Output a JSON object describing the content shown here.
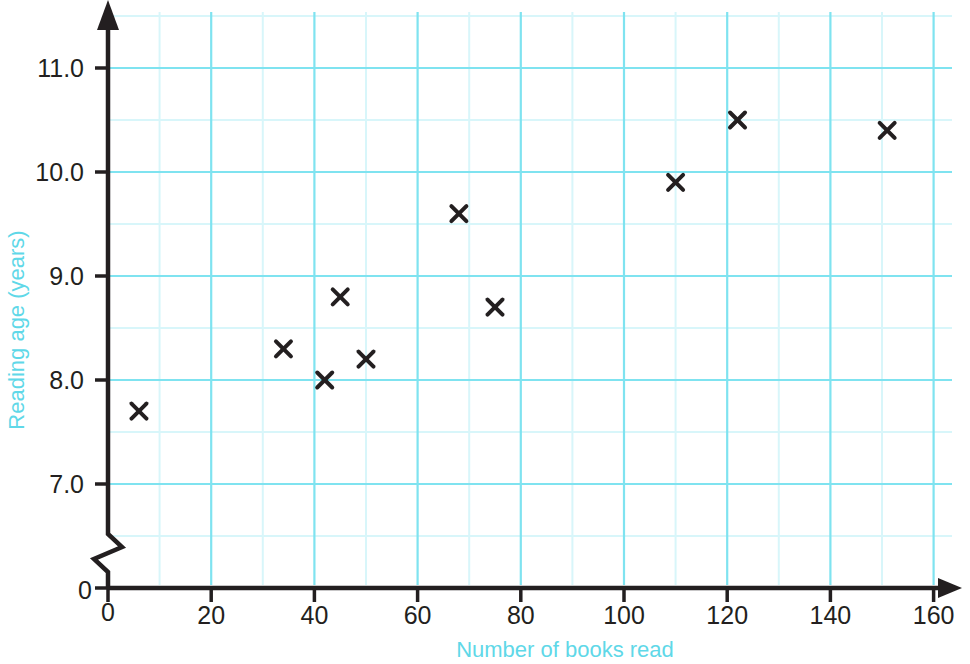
{
  "chart_data": {
    "type": "scatter",
    "title": "",
    "xlabel": "Number of books read",
    "ylabel": "Reading age (years)",
    "xlim": [
      0,
      168
    ],
    "ylim": [
      6.55,
      11.45
    ],
    "x_ticks": [
      0,
      20,
      40,
      60,
      80,
      100,
      120,
      140,
      160
    ],
    "x_tick_labels": [
      "0",
      "20",
      "40",
      "60",
      "80",
      "100",
      "120",
      "140",
      "160"
    ],
    "y_ticks": [
      7.0,
      8.0,
      9.0,
      10.0,
      11.0
    ],
    "y_tick_labels": [
      "7.0",
      "8.0",
      "9.0",
      "10.0",
      "11.0"
    ],
    "y_origin_label": "0",
    "x_origin_label": "0",
    "grid": true,
    "grid_major_color": "#7fe3f0",
    "grid_minor_color": "#d8f6fa",
    "x_minor_step": 10,
    "y_minor_step": 0.5,
    "axis_break_y": true,
    "marker": "x",
    "marker_color": "#231f20",
    "axis_color": "#231f20",
    "label_color": "#5fd8e8",
    "points": [
      {
        "x": 6,
        "y": 7.7
      },
      {
        "x": 34,
        "y": 8.3
      },
      {
        "x": 42,
        "y": 8.0
      },
      {
        "x": 45,
        "y": 8.8
      },
      {
        "x": 50,
        "y": 8.2
      },
      {
        "x": 68,
        "y": 9.6
      },
      {
        "x": 75,
        "y": 8.7
      },
      {
        "x": 110,
        "y": 9.9
      },
      {
        "x": 122,
        "y": 10.5
      },
      {
        "x": 151,
        "y": 10.4
      }
    ]
  }
}
